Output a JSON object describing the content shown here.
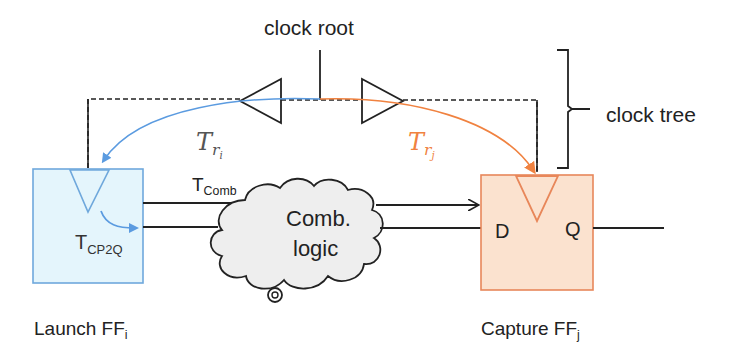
{
  "diagram": {
    "labels": {
      "clock_root": "clock root",
      "clock_tree": "clock tree",
      "t_ri_base": "T",
      "t_ri_sub": "r",
      "t_ri_subsub": "i",
      "t_rj_base": "T",
      "t_rj_sub": "r",
      "t_rj_subsub": "j",
      "t_comb_base": "T",
      "t_comb_sub": "Comb",
      "t_cp2q_base": "T",
      "t_cp2q_sub": "CP2Q",
      "comb_logic_line1": "Comb.",
      "comb_logic_line2": "logic",
      "capture_d": "D",
      "capture_q": "Q",
      "launch_ff_base": "Launch FF",
      "launch_ff_sub": "i",
      "capture_ff_base": "Capture FF",
      "capture_ff_sub": "j"
    },
    "colors": {
      "launch_fill": "#e4f5fc",
      "launch_stroke": "#6fa8dc",
      "launch_arrow": "#5b9be0",
      "capture_fill": "#fbe2cf",
      "capture_stroke": "#e8875a",
      "capture_arrow": "#f08240",
      "cloud_fill": "#eeeeee",
      "line": "#222222"
    }
  }
}
